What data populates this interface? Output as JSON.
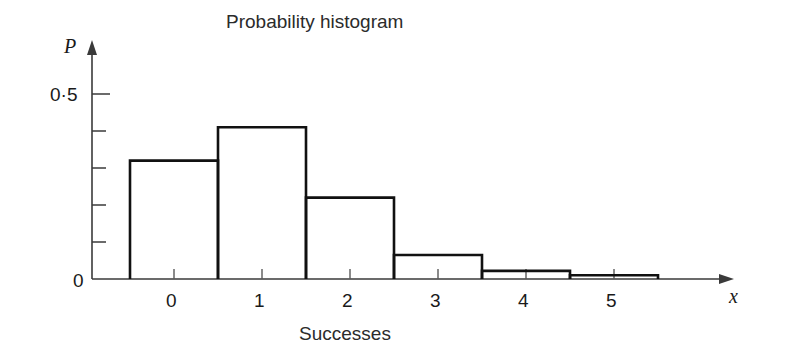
{
  "chart_data": {
    "type": "bar",
    "title": "Probability histogram",
    "xlabel": "Successes",
    "ylabel": "P",
    "x_axis_variable": "x",
    "categories": [
      "0",
      "1",
      "2",
      "3",
      "4",
      "5"
    ],
    "values": [
      0.32,
      0.41,
      0.22,
      0.065,
      0.022,
      0.01
    ],
    "xlim": [
      -0.5,
      5.95
    ],
    "ylim": [
      0,
      0.55
    ],
    "grid": false,
    "legend": null,
    "bar_width": 1.0,
    "y_tick_labels": [
      "0",
      "0·5"
    ],
    "y_tick_values": [
      0,
      0.5
    ],
    "y_minor_tick_values": [
      0.1,
      0.2,
      0.3,
      0.4
    ],
    "x_tick_values": [
      0,
      1,
      2,
      3,
      4,
      5
    ],
    "x_tick_labels": [
      "0",
      "1",
      "2",
      "3",
      "4",
      "5"
    ],
    "colors": {
      "background": "#ffffff",
      "bar_stroke": "#111111",
      "bar_fill": "none",
      "axis": "#3a3a3a",
      "text": "#1a1a1a"
    }
  }
}
